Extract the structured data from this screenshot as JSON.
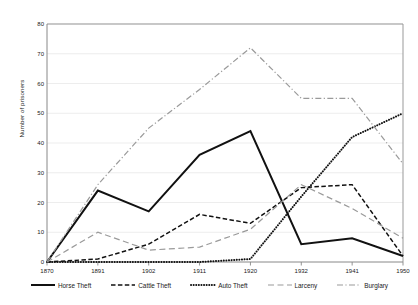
{
  "chart_data": {
    "type": "line",
    "title": "",
    "xlabel": "",
    "ylabel": "Number of prisoners",
    "x": [
      1870,
      1891,
      1902,
      1911,
      1920,
      1932,
      1941,
      1950
    ],
    "xticklabels": [
      "1870",
      "1891",
      "1902",
      "1911",
      "1920",
      "1932",
      "1941",
      "1950"
    ],
    "yticklabels": [
      "0",
      "10",
      "20",
      "30",
      "40",
      "50",
      "60",
      "70",
      "80"
    ],
    "ylim": [
      0,
      80
    ],
    "ytick_step": 10,
    "grid": "horizontal",
    "legend_position": "bottom",
    "series": [
      {
        "name": "Horse Theft",
        "style": "solid",
        "color": "#111111",
        "values": [
          0,
          24,
          17,
          36,
          44,
          6,
          8,
          2
        ]
      },
      {
        "name": "Cattle Theft",
        "style": "dashed",
        "color": "#111111",
        "values": [
          0,
          1,
          6,
          16,
          13,
          25,
          26,
          2
        ]
      },
      {
        "name": "Auto Theft",
        "style": "dotted",
        "color": "#111111",
        "values": [
          0,
          0,
          0,
          0,
          1,
          22,
          42,
          50
        ]
      },
      {
        "name": "Larceny",
        "style": "longdash",
        "color": "#9a9a9a",
        "values": [
          0,
          10,
          4,
          5,
          11,
          26,
          18,
          8
        ]
      },
      {
        "name": "Burglary",
        "style": "dashdot",
        "color": "#9a9a9a",
        "values": [
          0,
          26,
          45,
          58,
          72,
          55,
          55,
          33
        ]
      }
    ]
  },
  "axes": {
    "y_title": "Number of prisoners"
  }
}
